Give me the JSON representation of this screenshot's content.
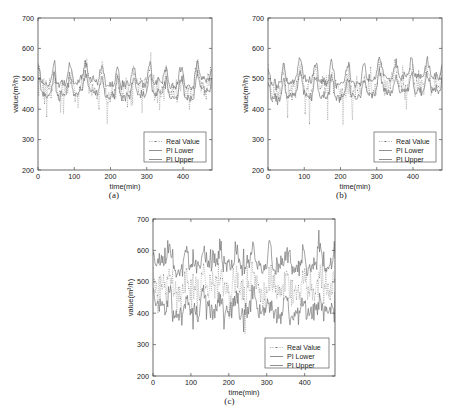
{
  "figure": {
    "background_color": "#ffffff",
    "panel_count": 3
  },
  "chart_data": [
    {
      "type": "line",
      "panel_id": "a",
      "caption": "(a)",
      "title": "",
      "xlabel": "time(min)",
      "ylabel": "value(m³/h)",
      "xlim": [
        0,
        480
      ],
      "ylim": [
        200,
        700
      ],
      "xticks": [
        0,
        100,
        200,
        300,
        400
      ],
      "yticks": [
        200,
        300,
        400,
        500,
        600,
        700
      ],
      "xtick_labels": [
        "0",
        "100",
        "200",
        "300",
        "400"
      ],
      "ytick_labels": [
        "200",
        "300",
        "400",
        "500",
        "600",
        "700"
      ],
      "grid": false,
      "legend_position": "lower right",
      "legend": [
        "Real Value",
        "PI Lower",
        "PI Upper"
      ],
      "noise_seed": 17,
      "n_points": 240,
      "period": 44,
      "baseline": 470,
      "peak_amplitude": 62,
      "real_noise": 52,
      "band_half_width": 14,
      "band_noise": 6,
      "series": [
        {
          "name": "Real Value",
          "style": "dotted-marker",
          "color": "#7d7d7d"
        },
        {
          "name": "PI Lower",
          "style": "solid",
          "color": "#6a6a6a"
        },
        {
          "name": "PI Upper",
          "style": "solid",
          "color": "#6a6a6a"
        }
      ]
    },
    {
      "type": "line",
      "panel_id": "b",
      "caption": "(b)",
      "title": "",
      "xlabel": "time(min)",
      "ylabel": "value(m³/h)",
      "xlim": [
        0,
        480
      ],
      "ylim": [
        200,
        700
      ],
      "xticks": [
        0,
        100,
        200,
        300,
        400
      ],
      "yticks": [
        200,
        300,
        400,
        500,
        600,
        700
      ],
      "xtick_labels": [
        "0",
        "100",
        "200",
        "300",
        "400"
      ],
      "ytick_labels": [
        "200",
        "300",
        "400",
        "500",
        "600",
        "700"
      ],
      "grid": false,
      "legend_position": "lower right",
      "legend": [
        "Real Value",
        "PI Lower",
        "PI Upper"
      ],
      "noise_seed": 31,
      "n_points": 240,
      "period": 44,
      "baseline": 470,
      "peak_amplitude": 60,
      "real_noise": 50,
      "band_half_width": 18,
      "band_noise": 7,
      "series": [
        {
          "name": "Real Value",
          "style": "dotted-marker",
          "color": "#7d7d7d"
        },
        {
          "name": "PI Lower",
          "style": "solid",
          "color": "#6a6a6a"
        },
        {
          "name": "PI Upper",
          "style": "solid",
          "color": "#6a6a6a"
        }
      ]
    },
    {
      "type": "line",
      "panel_id": "c",
      "caption": "(c)",
      "title": "",
      "xlabel": "time(min)",
      "ylabel": "value(m³/h)",
      "xlim": [
        0,
        480
      ],
      "ylim": [
        200,
        700
      ],
      "xticks": [
        0,
        100,
        200,
        300,
        400
      ],
      "yticks": [
        200,
        300,
        400,
        500,
        600,
        700
      ],
      "xtick_labels": [
        "0",
        "100",
        "200",
        "300",
        "400"
      ],
      "ytick_labels": [
        "200",
        "300",
        "400",
        "500",
        "600",
        "700"
      ],
      "grid": false,
      "legend_position": "lower right",
      "legend": [
        "Real Value",
        "PI Lower",
        "PI Upper"
      ],
      "noise_seed": 53,
      "n_points": 260,
      "period": 44,
      "baseline": 472,
      "peak_amplitude": 58,
      "real_noise": 56,
      "band_half_width": 52,
      "band_noise": 26,
      "series": [
        {
          "name": "Real Value",
          "style": "dotted-marker",
          "color": "#7d7d7d"
        },
        {
          "name": "PI Lower",
          "style": "solid",
          "color": "#6a6a6a"
        },
        {
          "name": "PI Upper",
          "style": "solid",
          "color": "#6a6a6a"
        }
      ]
    }
  ]
}
